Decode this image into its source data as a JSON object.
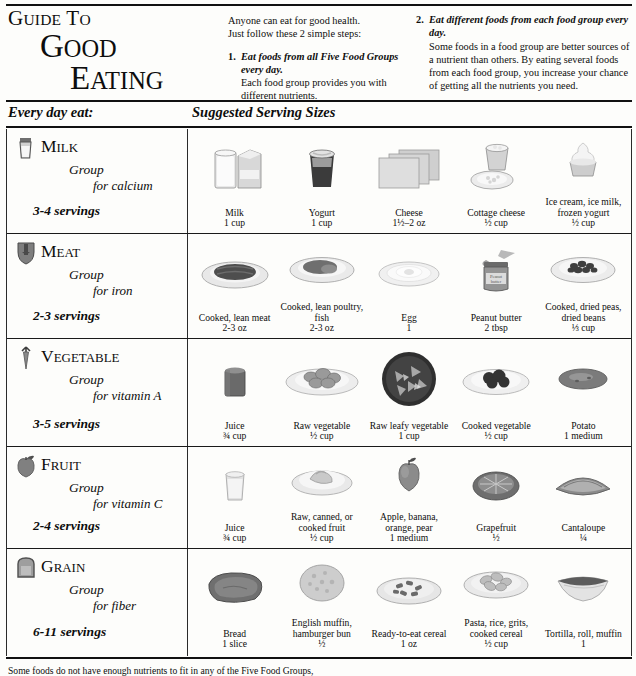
{
  "title": {
    "line1": "GUIDE TO",
    "line2": "GOOD",
    "line3": "EATING"
  },
  "intro": {
    "lead1": "Anyone can eat for good health.",
    "lead2": "Just follow these 2 simple steps:",
    "step1": {
      "num": "1.",
      "head": "Eat foods from all Five Food Groups every day.",
      "text": "Each food group provides you with different nutrients."
    },
    "step2": {
      "num": "2.",
      "head": "Eat different foods from each food group every day.",
      "text": "Some foods in a food group are better sources of a nutrient than others. By eating several foods from each food group, you increase your chance of getting all the nutrients you need."
    }
  },
  "bar": {
    "left": "Every day eat:",
    "right": "Suggested Serving Sizes"
  },
  "groups": [
    {
      "name": "MILK",
      "name_cap": "M",
      "name_rest": "ILK",
      "word": "Group",
      "nutrient": "for calcium",
      "servings": "3-4 servings",
      "icon": "milk-glass-icon",
      "foods": [
        {
          "name": "Milk",
          "amount": "1 cup",
          "art": "milk-carton-glass"
        },
        {
          "name": "Yogurt",
          "amount": "1 cup",
          "art": "yogurt-cup"
        },
        {
          "name": "Cheese",
          "amount": "1½–2 oz",
          "art": "cheese-slices"
        },
        {
          "name": "Cottage cheese",
          "amount": "½ cup",
          "art": "cottage-cheese-bowl"
        },
        {
          "name": "Ice cream, ice milk, frozen yogurt",
          "amount": "½ cup",
          "art": "ice-cream-cup"
        }
      ]
    },
    {
      "name": "MEAT",
      "name_cap": "M",
      "name_rest": "EAT",
      "word": "Group",
      "nutrient": "for iron",
      "servings": "2-3 servings",
      "icon": "meat-cut-icon",
      "foods": [
        {
          "name": "Cooked, lean meat",
          "amount": "2-3 oz",
          "art": "steak-plate"
        },
        {
          "name": "Cooked, lean poultry, fish",
          "amount": "2-3 oz",
          "art": "poultry-plate"
        },
        {
          "name": "Egg",
          "amount": "1",
          "art": "egg-plate"
        },
        {
          "name": "Peanut butter",
          "amount": "2 tbsp",
          "art": "peanut-butter-jar"
        },
        {
          "name": "Cooked, dried peas, dried beans",
          "amount": "⅓ cup",
          "art": "beans-plate"
        }
      ]
    },
    {
      "name": "VEGETABLE",
      "name_cap": "V",
      "name_rest": "EGETABLE",
      "word": "Group",
      "nutrient": "for vitamin  A",
      "servings": "3-5 servings",
      "icon": "carrot-icon",
      "foods": [
        {
          "name": "Juice",
          "amount": "¾ cup",
          "art": "veg-juice-glass"
        },
        {
          "name": "Raw vegetable",
          "amount": "½ cup",
          "art": "raw-veg-plate"
        },
        {
          "name": "Raw leafy vegetable",
          "amount": "1 cup",
          "art": "leafy-bowl"
        },
        {
          "name": "Cooked vegetable",
          "amount": "½ cup",
          "art": "cooked-veg-plate"
        },
        {
          "name": "Potato",
          "amount": "1 medium",
          "art": "potato"
        }
      ]
    },
    {
      "name": "FRUIT",
      "name_cap": "F",
      "name_rest": "RUIT",
      "word": "Group",
      "nutrient": "for vitamin  C",
      "servings": "2-4 servings",
      "icon": "apple-icon",
      "foods": [
        {
          "name": "Juice",
          "amount": "¾ cup",
          "art": "fruit-juice-glass"
        },
        {
          "name": "Raw, canned, or cooked fruit",
          "amount": "½ cup",
          "art": "canned-fruit-bowl"
        },
        {
          "name": "Apple, banana, orange, pear",
          "amount": "1 medium",
          "art": "whole-fruit"
        },
        {
          "name": "Grapefruit",
          "amount": "½",
          "art": "grapefruit-half"
        },
        {
          "name": "Cantaloupe",
          "amount": "¼",
          "art": "cantaloupe-wedge"
        }
      ]
    },
    {
      "name": "GRAIN",
      "name_cap": "G",
      "name_rest": "RAIN",
      "word": "Group",
      "nutrient": "for fiber",
      "servings": "6-11 servings",
      "icon": "bread-slice-icon",
      "foods": [
        {
          "name": "Bread",
          "amount": "1 slice",
          "art": "bread-slice"
        },
        {
          "name": "English muffin, hamburger bun",
          "amount": "½",
          "art": "muffin"
        },
        {
          "name": "Ready-to-eat cereal",
          "amount": "1 oz",
          "art": "cereal-bowl"
        },
        {
          "name": "Pasta, rice, grits, cooked cereal",
          "amount": "½ cup",
          "art": "pasta-bowl"
        },
        {
          "name": "Tortilla, roll, muffin",
          "amount": "1",
          "art": "tortilla"
        }
      ]
    }
  ],
  "footnote": "Some foods do not have enough nutrients to fit in any of the Five Food Groups,"
}
